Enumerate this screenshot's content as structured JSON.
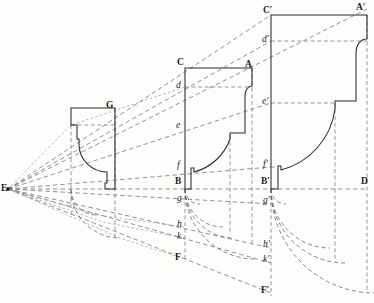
{
  "figure": {
    "type": "technical-line-drawing",
    "width": 374,
    "height": 303,
    "background_color": "#fdfdfb",
    "solid_line_color": "#2b2b2b",
    "dashed_line_color": "#6e6e6e"
  },
  "vertex": {
    "label": "E",
    "x": 8,
    "y": 189,
    "description": "common radiant point from which all projection rays diverge"
  },
  "labels": [
    {
      "id": "E",
      "text": "E",
      "style": "cap",
      "x": 2,
      "y": 184
    },
    {
      "id": "G",
      "text": "G",
      "style": "cap",
      "x": 106,
      "y": 102
    },
    {
      "id": "C",
      "text": "C",
      "style": "cap",
      "x": 177,
      "y": 59
    },
    {
      "id": "A",
      "text": "A",
      "style": "cap",
      "x": 245,
      "y": 61
    },
    {
      "id": "d",
      "text": "d",
      "style": "low",
      "x": 175,
      "y": 82
    },
    {
      "id": "e",
      "text": "e",
      "style": "low",
      "x": 175,
      "y": 122
    },
    {
      "id": "f",
      "text": "f",
      "style": "low",
      "x": 176,
      "y": 162
    },
    {
      "id": "B",
      "text": "B",
      "style": "cap",
      "x": 175,
      "y": 178
    },
    {
      "id": "g",
      "text": "g",
      "style": "low",
      "x": 176,
      "y": 195
    },
    {
      "id": "h",
      "text": "h",
      "style": "low",
      "x": 176,
      "y": 221
    },
    {
      "id": "k",
      "text": "k",
      "style": "low",
      "x": 176,
      "y": 233
    },
    {
      "id": "F",
      "text": "F",
      "style": "cap",
      "x": 175,
      "y": 254
    },
    {
      "id": "Cp",
      "text": "C′",
      "style": "cap",
      "x": 263,
      "y": 7
    },
    {
      "id": "Ap",
      "text": "A′",
      "style": "cap",
      "x": 357,
      "y": 4
    },
    {
      "id": "dp",
      "text": "d′",
      "style": "low",
      "x": 261,
      "y": 36
    },
    {
      "id": "ep",
      "text": "e′",
      "style": "low",
      "x": 261,
      "y": 98
    },
    {
      "id": "fp",
      "text": "f′",
      "style": "low",
      "x": 262,
      "y": 161
    },
    {
      "id": "Bp",
      "text": "B′",
      "style": "cap",
      "x": 261,
      "y": 178
    },
    {
      "id": "D",
      "text": "D",
      "style": "cap",
      "x": 361,
      "y": 178
    },
    {
      "id": "gp",
      "text": "g′",
      "style": "low",
      "x": 262,
      "y": 197
    },
    {
      "id": "hp",
      "text": "h′",
      "style": "low",
      "x": 262,
      "y": 241
    },
    {
      "id": "kp",
      "text": "k′",
      "style": "low",
      "x": 262,
      "y": 256
    },
    {
      "id": "Fp",
      "text": "F′",
      "style": "cap",
      "x": 261,
      "y": 287
    }
  ],
  "profiles": [
    {
      "name": "small-profile",
      "corner_label": "G",
      "scale": "smallest",
      "top_y": 108,
      "base_y": 189,
      "left_x": 71,
      "right_x": 115
    },
    {
      "name": "medium-profile",
      "corner_labels": [
        "C",
        "A",
        "d",
        "e",
        "f",
        "B"
      ],
      "scale": "medium",
      "top_y": 68,
      "base_y": 189,
      "left_x": 185,
      "right_x": 252
    },
    {
      "name": "large-profile",
      "corner_labels": [
        "C′",
        "A′",
        "d′",
        "e′",
        "f′",
        "B′"
      ],
      "scale": "largest",
      "top_y": 15,
      "base_y": 189,
      "left_x": 271,
      "right_x": 367
    }
  ],
  "baseline": {
    "name": "ground-line",
    "from_label": "E",
    "to_label": "D",
    "y": 189
  },
  "rays": [
    {
      "name": "ray-to-A-prime",
      "from": "E",
      "through": [
        "G",
        "A"
      ],
      "to": "A′"
    },
    {
      "name": "ray-to-C-prime",
      "from": "E",
      "through": [
        "C"
      ],
      "to": "C′"
    },
    {
      "name": "ray-to-d-prime",
      "from": "E",
      "through": [
        "d"
      ],
      "to": "d′"
    },
    {
      "name": "ray-to-e-prime",
      "from": "E",
      "through": [
        "e"
      ],
      "to": "e′"
    },
    {
      "name": "ray-to-f-prime",
      "from": "E",
      "through": [
        "f"
      ],
      "to": "f′"
    },
    {
      "name": "ray-to-B-prime",
      "from": "E",
      "through": [
        "B"
      ],
      "to": "D"
    },
    {
      "name": "ray-to-g-prime",
      "from": "E",
      "through": [
        "g"
      ],
      "to": "g′"
    },
    {
      "name": "ray-to-h-prime",
      "from": "E",
      "through": [
        "h"
      ],
      "to": "h′"
    },
    {
      "name": "ray-to-k-prime",
      "from": "E",
      "through": [
        "k"
      ],
      "to": "k′"
    },
    {
      "name": "ray-to-F-prime",
      "from": "E",
      "through": [
        "F"
      ],
      "to": "F′"
    }
  ],
  "arcs": {
    "name": "rectification-arcs",
    "count": 8,
    "description": "quarter-circle arcs rotating the vertical ordinates g,h,k,F and g',h',k',F' onto the horizontal base"
  }
}
